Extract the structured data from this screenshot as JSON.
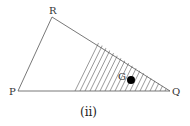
{
  "diagram": {
    "vertices": {
      "P": {
        "label": "P",
        "x": 18,
        "y": 91
      },
      "Q": {
        "label": "Q",
        "x": 170,
        "y": 91
      },
      "R": {
        "label": "R",
        "x": 52,
        "y": 17
      }
    },
    "point": {
      "label": "G",
      "x": 131,
      "y": 80,
      "r": 4
    },
    "shaded_region": {
      "start_x": 73,
      "hatch": "diagonal"
    },
    "caption": "(ii)",
    "colors": {
      "line": "#555555",
      "point": "#000000"
    }
  }
}
